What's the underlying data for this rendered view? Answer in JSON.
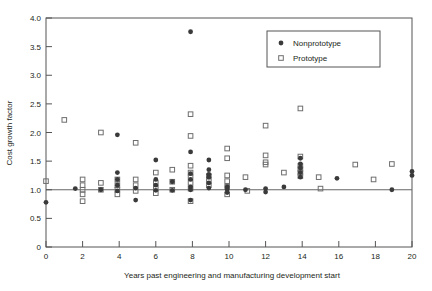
{
  "chart_data": {
    "type": "scatter",
    "title": "",
    "xlabel": "Years past engineering and manufacturing development start",
    "ylabel": "Cost growth factor",
    "xlim": [
      0,
      20
    ],
    "ylim": [
      0,
      4.0
    ],
    "xticks": [
      0,
      2,
      4,
      6,
      8,
      10,
      12,
      14,
      16,
      18,
      20
    ],
    "xtick_labels": [
      "0",
      "2",
      "4",
      "6",
      "8",
      "10",
      "12",
      "14",
      "16",
      "18",
      "20"
    ],
    "yticks": [
      0,
      0.5,
      1.0,
      1.5,
      2.0,
      2.5,
      3.0,
      3.5,
      4.0
    ],
    "ytick_labels": [
      "0",
      "0.5",
      "1.0",
      "1.5",
      "2.0",
      "2.5",
      "3.0",
      "3.5",
      "4.0"
    ],
    "grid": false,
    "reference_line": {
      "axis": "y",
      "value": 1.0,
      "label": ""
    },
    "legend": {
      "position": "top-right",
      "entries": [
        {
          "name": "Nonprototype",
          "marker": "filled-circle",
          "color": "#3a3a3a"
        },
        {
          "name": "Prototype",
          "marker": "open-square",
          "color": "#6e6e6e"
        }
      ]
    },
    "series": [
      {
        "name": "Nonprototype",
        "marker": "filled-circle",
        "color": "#3a3a3a",
        "points": [
          [
            0.0,
            0.78
          ],
          [
            1.6,
            1.02
          ],
          [
            3.0,
            1.0
          ],
          [
            3.9,
            1.96
          ],
          [
            3.9,
            1.3
          ],
          [
            3.9,
            1.18
          ],
          [
            3.9,
            1.08
          ],
          [
            3.9,
            0.98
          ],
          [
            4.9,
            1.03
          ],
          [
            4.9,
            0.82
          ],
          [
            6.0,
            1.52
          ],
          [
            6.0,
            1.18
          ],
          [
            6.0,
            1.08
          ],
          [
            6.0,
            0.99
          ],
          [
            6.9,
            1.14
          ],
          [
            6.9,
            0.99
          ],
          [
            7.9,
            3.76
          ],
          [
            7.9,
            1.66
          ],
          [
            7.9,
            1.28
          ],
          [
            7.9,
            1.18
          ],
          [
            7.9,
            1.05
          ],
          [
            7.9,
            1.0
          ],
          [
            7.9,
            0.82
          ],
          [
            8.9,
            1.52
          ],
          [
            8.9,
            1.35
          ],
          [
            8.9,
            1.27
          ],
          [
            8.9,
            1.22
          ],
          [
            8.9,
            1.12
          ],
          [
            8.9,
            1.03
          ],
          [
            9.9,
            1.05
          ],
          [
            9.9,
            1.0
          ],
          [
            9.9,
            0.95
          ],
          [
            10.9,
            1.0
          ],
          [
            12.0,
            1.02
          ],
          [
            12.0,
            0.96
          ],
          [
            13.0,
            1.05
          ],
          [
            13.9,
            1.55
          ],
          [
            13.9,
            1.45
          ],
          [
            13.9,
            1.38
          ],
          [
            13.9,
            1.3
          ],
          [
            13.9,
            1.22
          ],
          [
            15.9,
            1.2
          ],
          [
            18.9,
            1.0
          ],
          [
            20.0,
            1.32
          ],
          [
            20.0,
            1.25
          ]
        ]
      },
      {
        "name": "Prototype",
        "marker": "open-square",
        "color": "#6e6e6e",
        "points": [
          [
            0.0,
            1.15
          ],
          [
            1.0,
            2.22
          ],
          [
            2.0,
            1.18
          ],
          [
            2.0,
            1.08
          ],
          [
            2.0,
            1.0
          ],
          [
            2.0,
            0.92
          ],
          [
            2.0,
            0.8
          ],
          [
            3.0,
            2.0
          ],
          [
            3.0,
            1.12
          ],
          [
            3.0,
            1.0
          ],
          [
            3.9,
            1.18
          ],
          [
            3.9,
            1.08
          ],
          [
            3.9,
            1.0
          ],
          [
            3.9,
            0.92
          ],
          [
            4.9,
            1.82
          ],
          [
            4.9,
            1.18
          ],
          [
            4.9,
            1.08
          ],
          [
            4.9,
            0.98
          ],
          [
            6.0,
            1.3
          ],
          [
            6.0,
            1.12
          ],
          [
            6.0,
            1.02
          ],
          [
            6.0,
            0.94
          ],
          [
            6.9,
            1.35
          ],
          [
            6.9,
            1.14
          ],
          [
            6.9,
            1.0
          ],
          [
            7.9,
            2.32
          ],
          [
            7.9,
            1.94
          ],
          [
            7.9,
            1.42
          ],
          [
            7.9,
            1.3
          ],
          [
            7.9,
            1.22
          ],
          [
            7.9,
            1.12
          ],
          [
            7.9,
            1.02
          ],
          [
            7.9,
            0.8
          ],
          [
            8.9,
            1.24
          ],
          [
            8.9,
            1.15
          ],
          [
            8.9,
            1.08
          ],
          [
            9.9,
            1.72
          ],
          [
            9.9,
            1.55
          ],
          [
            9.9,
            1.25
          ],
          [
            9.9,
            1.15
          ],
          [
            9.9,
            1.05
          ],
          [
            9.9,
            0.92
          ],
          [
            10.9,
            1.22
          ],
          [
            11.0,
            0.98
          ],
          [
            12.0,
            2.12
          ],
          [
            12.0,
            1.6
          ],
          [
            12.0,
            1.48
          ],
          [
            12.0,
            1.44
          ],
          [
            13.0,
            1.3
          ],
          [
            13.9,
            2.42
          ],
          [
            13.9,
            1.58
          ],
          [
            13.9,
            1.42
          ],
          [
            13.9,
            1.36
          ],
          [
            13.9,
            1.3
          ],
          [
            13.9,
            1.24
          ],
          [
            14.9,
            1.22
          ],
          [
            15.0,
            1.02
          ],
          [
            16.9,
            1.44
          ],
          [
            17.9,
            1.18
          ],
          [
            18.9,
            1.45
          ]
        ]
      }
    ]
  }
}
